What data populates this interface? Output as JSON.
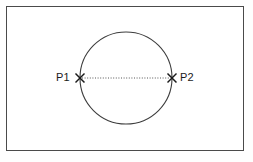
{
  "figure": {
    "title": "",
    "background_color": "#fefefe",
    "frame": {
      "border_color": "#4a4a4a",
      "fill_color": "#ffffff"
    }
  },
  "shapes": {
    "circle": {
      "name": "circle",
      "center_x": 126,
      "center_y": 78,
      "radius": 46,
      "stroke_color": "#3d3d3d",
      "fill": "none"
    },
    "chord": {
      "name": "dotted-diameter-line",
      "style": "dotted",
      "stroke_color": "#555555",
      "from_x": 80,
      "from_y": 78,
      "to_x": 172,
      "to_y": 78
    }
  },
  "points": [
    {
      "id": "p1",
      "label": "P1",
      "marker": "x-marker",
      "x": 80,
      "y": 78,
      "label_side": "left"
    },
    {
      "id": "p2",
      "label": "P2",
      "marker": "x-marker",
      "x": 172,
      "y": 78,
      "label_side": "right"
    }
  ]
}
